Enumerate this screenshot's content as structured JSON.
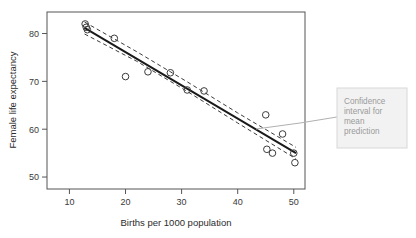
{
  "figure": {
    "background_color": "#ffffff",
    "frame_color": "#555555",
    "axis_text_color": "#3a3a3a"
  },
  "annotation": {
    "name": "confidence-interval-callout",
    "lines": [
      "Confidence",
      "interval for",
      "mean",
      "prediction"
    ],
    "text": "Confidence interval for mean prediction",
    "box_fill": "#f2f2f2",
    "box_border": "#d8d8d8",
    "text_color": "#9a9a9a",
    "leader_color": "#b0b0b0"
  },
  "chart_data": {
    "type": "scatter",
    "title": "",
    "xlabel": "Births per 1000 population",
    "ylabel": "Female life expectancy",
    "xlim": [
      6,
      52
    ],
    "ylim": [
      47.5,
      84.5
    ],
    "xticks": [
      10,
      20,
      30,
      40,
      50
    ],
    "yticks": [
      50,
      60,
      70,
      80
    ],
    "grid": false,
    "legend": "none",
    "marker": "open-circle",
    "marker_color": "#3b3b3b",
    "points": [
      {
        "x": 12.8,
        "y": 82.0
      },
      {
        "x": 13.0,
        "y": 81.3
      },
      {
        "x": 13.2,
        "y": 80.8
      },
      {
        "x": 18.0,
        "y": 79.0
      },
      {
        "x": 20.0,
        "y": 71.0
      },
      {
        "x": 24.0,
        "y": 72.0
      },
      {
        "x": 28.0,
        "y": 71.8
      },
      {
        "x": 31.0,
        "y": 68.2
      },
      {
        "x": 34.0,
        "y": 68.0
      },
      {
        "x": 45.0,
        "y": 63.0
      },
      {
        "x": 45.2,
        "y": 55.8
      },
      {
        "x": 46.2,
        "y": 55.0
      },
      {
        "x": 48.0,
        "y": 59.0
      },
      {
        "x": 50.0,
        "y": 55.0
      },
      {
        "x": 50.2,
        "y": 53.0
      }
    ],
    "fit_line": {
      "name": "regression-line",
      "color": "#1a1a1a",
      "style": "solid",
      "x": [
        12.7,
        50.4
      ],
      "y": [
        81.2,
        55.0
      ]
    },
    "confidence_band": {
      "name": "confidence-interval-band",
      "color": "#3b3b3b",
      "style": "dashed",
      "upper": {
        "x": [
          12.7,
          22.0,
          31.0,
          40.0,
          50.4
        ],
        "y": [
          82.4,
          76.2,
          69.9,
          63.4,
          56.2
        ]
      },
      "lower": {
        "x": [
          12.7,
          22.0,
          31.0,
          40.0,
          50.4
        ],
        "y": [
          79.9,
          74.2,
          67.9,
          61.3,
          53.8
        ]
      }
    }
  }
}
